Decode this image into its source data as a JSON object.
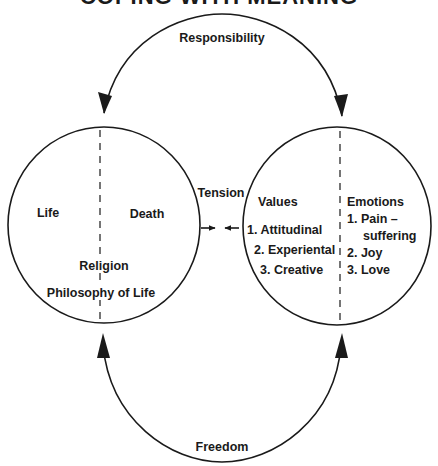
{
  "title": "COPING WITH MEANING",
  "arcs": {
    "top_label": "Responsibility",
    "bottom_label": "Freedom"
  },
  "left_circle": {
    "left_label": "Life",
    "right_label": "Death",
    "bottom_label_1": "Religion",
    "bottom_label_2": "Philosophy of Life"
  },
  "tension": {
    "label": "Tension"
  },
  "right_circle": {
    "values_heading": "Values",
    "values": [
      "1. Attitudinal",
      "2. Experiental",
      "3. Creative"
    ],
    "emotions_heading": "Emotions",
    "emotions": [
      "1. Pain –",
      "suffering",
      "2. Joy",
      "3. Love"
    ]
  },
  "colors": {
    "ink": "#1a1a1a",
    "background": "#ffffff"
  }
}
